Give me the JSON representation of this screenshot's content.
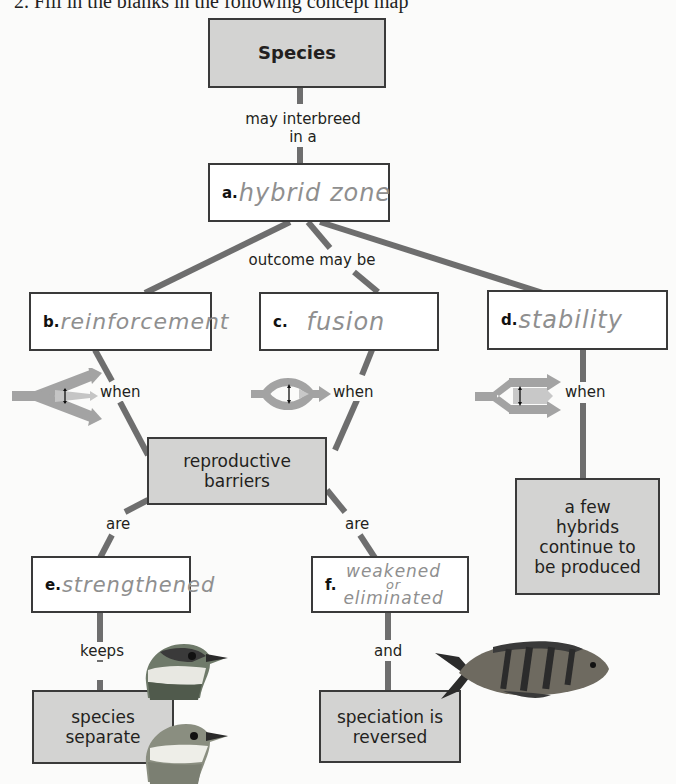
{
  "page": {
    "header_text": "2. Fill in the blanks in the following concept map"
  },
  "concept_map": {
    "root": {
      "label": "Species"
    },
    "link_root_to_a": "may interbreed in a",
    "link_root_to_a_line1": "may interbreed",
    "link_root_to_a_line2": "in a",
    "node_a": {
      "letter": "a.",
      "answer": "hybrid zone"
    },
    "link_a_to_outcomes": "outcome may be",
    "node_b": {
      "letter": "b.",
      "answer": "reinforcement"
    },
    "node_c": {
      "letter": "c.",
      "answer": "fusion"
    },
    "node_d": {
      "letter": "d.",
      "answer": "stability"
    },
    "when_label_b": "when",
    "when_label_c": "when",
    "when_label_d": "when",
    "node_barriers": {
      "line1": "reproductive",
      "line2": "barriers"
    },
    "are_label_e": "are",
    "are_label_f": "are",
    "node_e": {
      "letter": "e.",
      "answer": "strengthened"
    },
    "node_f": {
      "letter": "f.",
      "answer_line1": "weakened",
      "answer_line2": "or",
      "answer_line3": "eliminated"
    },
    "link_e_keeps": "keeps",
    "link_f_and": "and",
    "node_separate": {
      "line1": "species",
      "line2": "separate"
    },
    "node_reversed": {
      "line1": "speciation is",
      "line2": "reversed"
    },
    "node_hybrids": {
      "line1": "a few",
      "line2": "hybrids",
      "line3": "continue to",
      "line4": "be produced"
    },
    "icons": {
      "reinforcement_arrow": "diverging-arrows-icon",
      "fusion_arrow": "merging-arrows-icon",
      "stability_arrow": "parallel-arrows-icon",
      "bird_top": "bird-head-icon",
      "bird_bottom": "bird-head-icon",
      "fish": "fish-icon"
    },
    "colors": {
      "box_fill_gray": "#d3d3d2",
      "box_border": "#3a3a3a",
      "connector": "#6e6e6e",
      "arrow_gray": "#9a9a9a",
      "handwriting": "#8f8f8f"
    }
  }
}
